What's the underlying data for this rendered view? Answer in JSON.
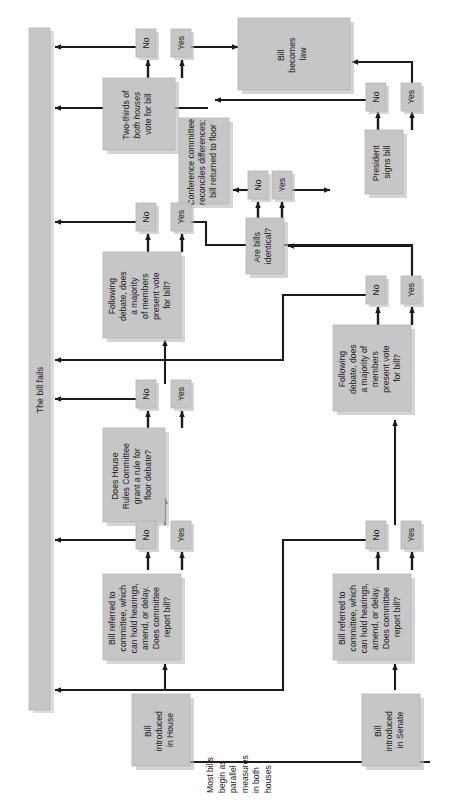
{
  "diagram": {
    "orientation": "rotated-90-ccw",
    "colors": {
      "box_fill": "#c6c6c6",
      "box_stroke": "#b0b0b0",
      "shadow": "#b9b9b9",
      "line": "#1b1b1b",
      "text": "#1b1b1b",
      "background": "#ffffff"
    }
  },
  "fail_bar": {
    "label": "The bill fails"
  },
  "note": {
    "text": "Most bills begin as parallel measures in both houses",
    "lines": [
      "Most bills",
      "begin as",
      "parallel",
      "measures",
      "in both",
      "houses"
    ]
  },
  "nodes": {
    "bill_house": {
      "id": "bill-introduced-house",
      "lines": [
        "Bill",
        "introduced",
        "in House"
      ]
    },
    "bill_senate": {
      "id": "bill-introduced-senate",
      "lines": [
        "Bill",
        "introduced",
        "in Senate"
      ]
    },
    "committee_house": {
      "id": "committee-referral-house",
      "lines": [
        "Bill referred to",
        "committee, which",
        "can hold hearings,",
        "amend, or delay.",
        "Does committee",
        "report bill?"
      ]
    },
    "committee_senate": {
      "id": "committee-referral-senate",
      "lines": [
        "Bill referred to",
        "committee, which",
        "can hold hearings,",
        "amend, or delay.",
        "Does committee",
        "report bill?"
      ]
    },
    "rules_committee": {
      "id": "house-rules-committee",
      "lines": [
        "Does House",
        "Rules Committee",
        "grant a rule for",
        "floor debate?"
      ]
    },
    "floor_vote_house": {
      "id": "floor-vote-house",
      "lines": [
        "Following",
        "debate, does",
        "a majority",
        "of members",
        "present vote",
        "for bill?"
      ]
    },
    "floor_vote_senate": {
      "id": "floor-vote-senate",
      "lines": [
        "Following",
        "debate, does",
        "a majority of",
        "members",
        "present vote",
        "for bill?"
      ]
    },
    "identical": {
      "id": "are-bills-identical",
      "lines": [
        "Are bills",
        "identical?"
      ]
    },
    "conference": {
      "id": "conference-committee",
      "lines": [
        "Conference committee",
        "reconciles differences;",
        "bill returned to floor"
      ]
    },
    "president": {
      "id": "president-signs-bill",
      "lines": [
        "President",
        "signs bill"
      ]
    },
    "two_thirds": {
      "id": "two-thirds-override",
      "lines": [
        "Two-thirds of",
        "both houses",
        "vote for bill"
      ],
      "italic_line_index": 1
    },
    "becomes_law": {
      "id": "bill-becomes-law",
      "lines": [
        "Bill",
        "becomes",
        "law"
      ]
    }
  },
  "decision_labels": {
    "yes": "Yes",
    "no": "No"
  },
  "branches": [
    {
      "from": "committee-referral-house",
      "no": "No",
      "yes": "Yes"
    },
    {
      "from": "house-rules-committee",
      "no": "No",
      "yes": "Yes"
    },
    {
      "from": "floor-vote-house",
      "no": "No",
      "yes": "Yes"
    },
    {
      "from": "committee-referral-senate",
      "no": "No",
      "yes": "Yes"
    },
    {
      "from": "floor-vote-senate",
      "no": "No",
      "yes": "Yes"
    },
    {
      "from": "are-bills-identical",
      "no": "No",
      "yes": "Yes"
    },
    {
      "from": "president-signs-bill",
      "no": "No",
      "yes": "Yes"
    },
    {
      "from": "two-thirds-override",
      "no": "No",
      "yes": "Yes"
    }
  ]
}
